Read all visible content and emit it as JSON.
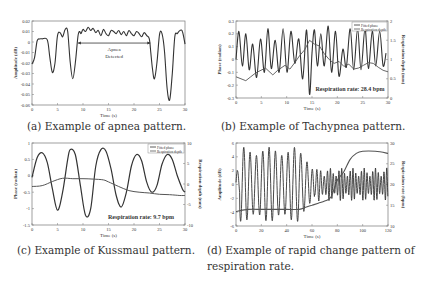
{
  "figure": {
    "panels": [
      {
        "id": "a",
        "caption": "(a) Example of apnea pattern."
      },
      {
        "id": "b",
        "caption": "(b) Example of Tachypnea pattern."
      },
      {
        "id": "c",
        "caption": "(c) Example of Kussmaul pattern."
      },
      {
        "id": "d",
        "caption_line1": "(d) Example of rapid change pattern of",
        "caption_line2": "respiration rate."
      }
    ]
  },
  "chart_data": [
    {
      "id": "a",
      "type": "line",
      "title": "",
      "xlabel": "Time (s)",
      "ylabel": "Amplitude (dB)",
      "xlim": [
        0,
        30
      ],
      "ylim": [
        -0.06,
        0.02
      ],
      "xticks": [
        "0",
        "5",
        "10",
        "15",
        "20",
        "25",
        "30"
      ],
      "yticks": [
        "0.02",
        "0.01",
        "0",
        "-0.01",
        "-0.02",
        "-0.03",
        "-0.04",
        "-0.05",
        "-0.06"
      ],
      "annotation": {
        "text_line1": "Apnea",
        "text_line2": "Detected",
        "x_start": 9.0,
        "x_end": 23.2,
        "y": -0.001
      },
      "series": [
        {
          "name": "Amplitude",
          "x": [
            0,
            0.5,
            1,
            1.5,
            2,
            3,
            3.5,
            4,
            4.5,
            5,
            5.5,
            6,
            6.5,
            7,
            7.5,
            8,
            8.5,
            9,
            9.3,
            9.6,
            10,
            10.5,
            11,
            11.5,
            12,
            12.5,
            13,
            13.5,
            14,
            14.5,
            15,
            15.5,
            16,
            16.5,
            17,
            17.5,
            18,
            18.5,
            19,
            19.5,
            20,
            20.5,
            21,
            21.5,
            22,
            22.5,
            23,
            23.3,
            23.6,
            24,
            24.5,
            25,
            25.5,
            26,
            26.5,
            27,
            27.5,
            28,
            28.5,
            29,
            29.5,
            30
          ],
          "y": [
            -0.021,
            -0.015,
            0.001,
            0.003,
            0.003,
            0.002,
            -0.015,
            -0.029,
            -0.02,
            0.006,
            0.009,
            0.005,
            0.012,
            0.01,
            -0.02,
            -0.035,
            -0.02,
            0.005,
            0.01,
            0.008,
            0.012,
            0.01,
            0.014,
            0.011,
            0.013,
            0.009,
            0.011,
            0.006,
            0.012,
            0.008,
            0.006,
            0.011,
            0.01,
            0.008,
            0.011,
            0.007,
            0.01,
            0.006,
            0.011,
            0.008,
            0.006,
            0.01,
            0.008,
            0.005,
            0.009,
            0.006,
            0.003,
            -0.01,
            -0.025,
            -0.035,
            -0.02,
            0.007,
            0.008,
            -0.01,
            -0.045,
            -0.055,
            -0.03,
            0.005,
            0.008,
            0.011,
            0.01,
            -0.002
          ]
        }
      ],
      "grid": false
    },
    {
      "id": "b",
      "type": "line",
      "title": "",
      "xlabel": "Time (s)",
      "ylabel": "Phase (radian)",
      "ylabel_right": "Respiration depth (mm)",
      "xlim": [
        0,
        31
      ],
      "ylim": [
        -0.3,
        0.3
      ],
      "ylim_right": [
        0,
        2
      ],
      "xticks": [
        "0",
        "5",
        "10",
        "15",
        "20",
        "25",
        "30"
      ],
      "yticks": [
        "0.3",
        "0.2",
        "0.1",
        "0",
        "-0.1",
        "-0.2",
        "-0.3"
      ],
      "yticks_right": [
        "2",
        "1.5",
        "1",
        "0.5",
        "0"
      ],
      "legend": [
        "Fitted phase",
        "Respiration depth"
      ],
      "legend_position": "upper right",
      "annotation": "Respiration rate: 28.4 bpm",
      "series": [
        {
          "name": "Fitted phase",
          "axis": "left",
          "x": [
            0,
            0.6,
            1.3,
            2,
            2.7,
            3.4,
            4.2,
            5,
            5.8,
            6.5,
            7.2,
            8,
            8.8,
            9.6,
            10.4,
            11.2,
            12,
            12.8,
            13.6,
            14.4,
            15,
            15.5,
            16,
            16.6,
            17.3,
            18,
            18.8,
            19.5,
            20.3,
            21,
            21.8,
            22.5,
            23.3,
            24,
            24.8,
            25.5,
            26.3,
            27,
            27.8,
            28.5,
            29.3,
            30,
            30.6
          ],
          "y": [
            0,
            0.22,
            -0.05,
            0.2,
            -0.08,
            0.12,
            -0.14,
            0.16,
            -0.1,
            0.24,
            -0.07,
            0.15,
            -0.1,
            0.24,
            -0.1,
            0.22,
            -0.03,
            0.16,
            -0.15,
            0.23,
            -0.27,
            0.05,
            0.23,
            -0.05,
            0.2,
            -0.05,
            0.26,
            -0.1,
            0.22,
            -0.13,
            0.08,
            -0.06,
            0.24,
            -0.08,
            0.24,
            -0.08,
            0.24,
            -0.07,
            0.22,
            -0.05,
            0.22,
            -0.05,
            0.05
          ]
        },
        {
          "name": "Respiration depth",
          "axis": "right",
          "x": [
            0,
            2,
            3,
            4,
            6,
            7.5,
            8.5,
            10,
            11,
            12,
            13,
            14,
            15,
            16,
            17,
            18,
            19,
            20,
            21,
            22,
            23,
            24,
            25,
            26,
            27,
            28,
            29,
            30,
            31
          ],
          "y": [
            0.55,
            0.45,
            0.55,
            0.65,
            0.78,
            0.6,
            0.72,
            0.85,
            0.75,
            0.92,
            1.1,
            1.25,
            1.5,
            1.4,
            1.35,
            1.15,
            1.0,
            0.9,
            0.95,
            0.82,
            0.88,
            0.75,
            0.78,
            0.85,
            0.92,
            0.9,
            0.8,
            0.72,
            0.68
          ]
        }
      ],
      "grid": false
    },
    {
      "id": "c",
      "type": "line",
      "title": "",
      "xlabel": "Time (s)",
      "ylabel": "Phase (radian)",
      "ylabel_right": "Respiration depth (mm)",
      "xlim": [
        0,
        30
      ],
      "ylim": [
        -1.5,
        1
      ],
      "ylim_right": [
        -10,
        10
      ],
      "xticks": [
        "0",
        "5",
        "10",
        "15",
        "20",
        "25",
        "30"
      ],
      "yticks": [
        "1",
        "0.5",
        "0",
        "-0.5",
        "-1",
        "-1.5"
      ],
      "yticks_right": [
        "10",
        "5",
        "0",
        "-5",
        "-10"
      ],
      "legend": [
        "Fitted phase",
        "Respiration depth"
      ],
      "legend_position": "upper right",
      "annotation": "Respiration rate: 9.7 bpm",
      "series": [
        {
          "name": "Fitted phase",
          "axis": "left",
          "x": [
            0,
            1,
            2,
            3,
            4,
            5,
            6,
            7,
            7.5,
            8.5,
            9.5,
            10.5,
            11.5,
            12.5,
            13.5,
            14.5,
            15.5,
            16.5,
            17.5,
            18.5,
            19.5,
            20.5,
            21.5,
            22.5,
            23.5,
            24.5,
            25.5,
            26.5,
            27.5,
            28.5,
            29.5,
            30
          ],
          "y": [
            -0.05,
            0.55,
            0.7,
            0.4,
            -0.4,
            -1.05,
            -0.5,
            0.5,
            0.8,
            0.65,
            -0.3,
            -1.2,
            -1.0,
            0.3,
            0.8,
            0.75,
            0.2,
            -0.6,
            -0.95,
            -0.5,
            0.3,
            0.65,
            0.45,
            -0.2,
            -0.5,
            -0.3,
            0.35,
            0.65,
            0.5,
            0.0,
            -0.4,
            -0.5
          ]
        },
        {
          "name": "Respiration depth",
          "axis": "right",
          "x": [
            0,
            2,
            4,
            6,
            8,
            10,
            12,
            14,
            15,
            17,
            19,
            21,
            23,
            25,
            27,
            29,
            30
          ],
          "y": [
            -0.6,
            -0.4,
            0.6,
            1.4,
            1.3,
            1.3,
            1.2,
            1.0,
            0.5,
            -0.6,
            -1.6,
            -2.0,
            -2.2,
            -2.5,
            -2.6,
            -2.8,
            -2.8
          ]
        }
      ],
      "grid": false
    },
    {
      "id": "d",
      "type": "line",
      "title": "",
      "xlabel": "Time (s)",
      "ylabel": "Amplitude (dB)",
      "ylabel_right": "Respiration rate (bpm)",
      "xlim": [
        0,
        120
      ],
      "ylim": [
        -6,
        6
      ],
      "ylim_right": [
        10,
        30
      ],
      "xticks": [
        "0",
        "20",
        "40",
        "60",
        "80",
        "100",
        "120"
      ],
      "yticks": [
        "6",
        "4",
        "2",
        "0",
        "-2",
        "-4",
        "-6"
      ],
      "yticks_right": [
        "30",
        "25",
        "20",
        "15",
        "10"
      ],
      "series": [
        {
          "name": "Amplitude",
          "axis": "left",
          "note": "oscillating signal, amplitude ~±5 dB for t<50s, shrinking to ~±2 dB after 60s with increasing frequency"
        },
        {
          "name": "Respiration rate",
          "axis": "right",
          "x": [
            0,
            10,
            20,
            30,
            40,
            50,
            55,
            60,
            65,
            70,
            75,
            80,
            85,
            90,
            95,
            100,
            110,
            120
          ],
          "y": [
            13.5,
            14,
            14,
            14,
            14,
            14,
            14.5,
            15,
            15.5,
            16,
            17,
            21,
            23,
            26,
            27.5,
            28,
            28,
            27.5
          ]
        }
      ],
      "grid": false
    }
  ]
}
